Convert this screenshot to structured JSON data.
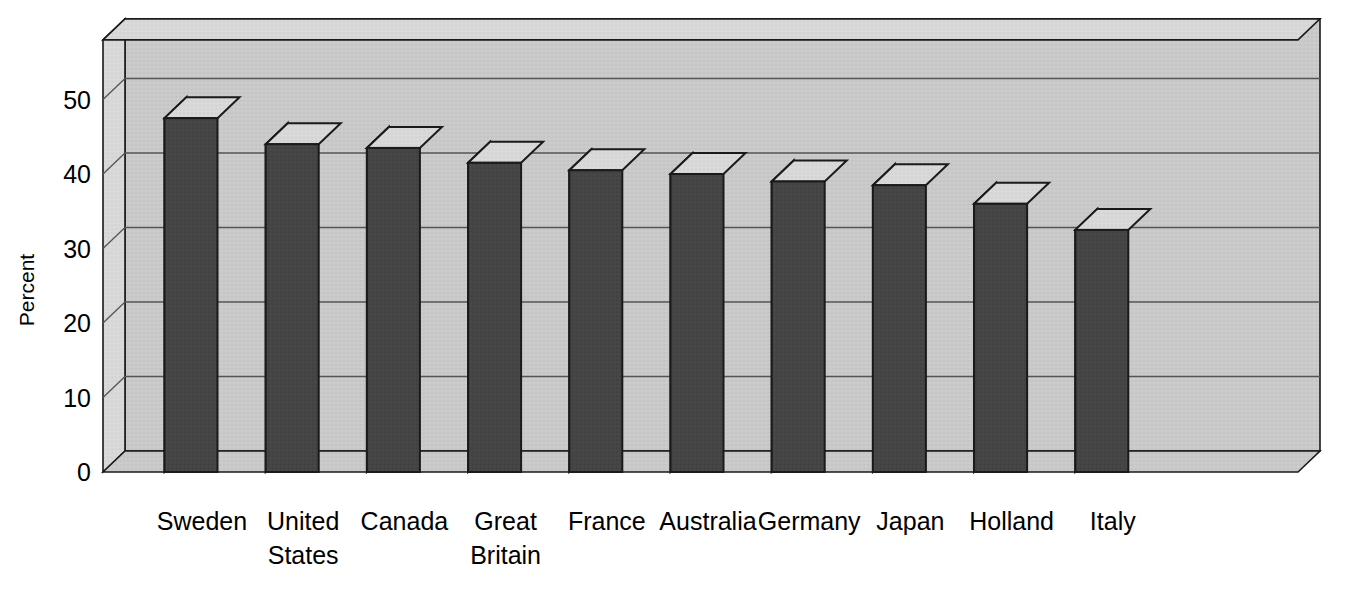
{
  "chart_data": {
    "type": "bar",
    "title": "",
    "xlabel": "",
    "ylabel": "Percent",
    "ylim": [
      0,
      58
    ],
    "yticks": [
      0,
      10,
      20,
      30,
      40,
      50
    ],
    "ytick_labels": [
      "0",
      "10",
      "20",
      "30",
      "40",
      "50"
    ],
    "grid": true,
    "legend": "none",
    "style": "3d-bar",
    "categories": [
      "Sweden",
      "United States",
      "Canada",
      "Great Britain",
      "France",
      "Australia",
      "Germany",
      "Japan",
      "Holland",
      "Italy"
    ],
    "category_lines": [
      [
        "Sweden"
      ],
      [
        "United",
        "States"
      ],
      [
        "Canada"
      ],
      [
        "Great",
        "Britain"
      ],
      [
        "France"
      ],
      [
        "Australia"
      ],
      [
        "Germany"
      ],
      [
        "Japan"
      ],
      [
        "Holland"
      ],
      [
        "Italy"
      ]
    ],
    "values": [
      47.5,
      44,
      43.5,
      41.5,
      40.5,
      40,
      39,
      38.5,
      36,
      32.5
    ]
  },
  "colors": {
    "bar_front": "#454545",
    "bar_top": "#d8d8d8",
    "bar_side": "#d8d8d8",
    "wall_back": "#c9c9c9",
    "wall_side": "#d5d5d5",
    "floor": "#c9c9c9",
    "outline": "#1a1a1a",
    "gridline": "#555555",
    "text": "#000000",
    "background": "#ffffff"
  }
}
